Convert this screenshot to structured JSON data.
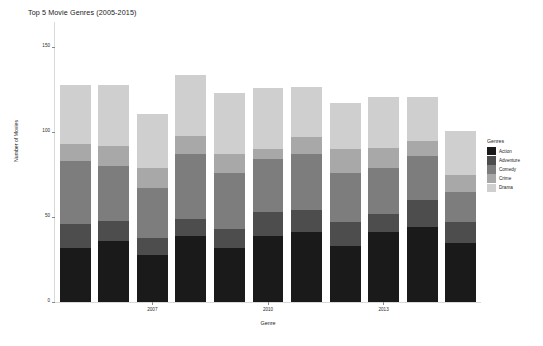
{
  "chart_data": {
    "type": "bar",
    "title": "Top 5 Movie Genres (2005-2015)",
    "xlabel": "Genre",
    "ylabel": "Number of Movies",
    "stacked": true,
    "grid": false,
    "legend_position": "right",
    "legend_title": "Genres",
    "ylim": [
      0,
      165
    ],
    "yticks": [
      0,
      50,
      100,
      150
    ],
    "ytick_labels": [
      "0",
      "50",
      "100",
      "150"
    ],
    "categories": [
      "2005",
      "2006",
      "2007",
      "2008",
      "2009",
      "2010",
      "2011",
      "2012",
      "2013",
      "2014",
      "2015"
    ],
    "xticks": [
      "2007",
      "2010",
      "2013"
    ],
    "series": [
      {
        "name": "Action",
        "color": "#1a1a1a",
        "values": [
          32,
          36,
          28,
          39,
          32,
          39,
          41,
          33,
          41,
          44,
          35
        ]
      },
      {
        "name": "Adventure",
        "color": "#4d4d4d",
        "values": [
          14,
          12,
          10,
          10,
          11,
          14,
          13,
          14,
          11,
          16,
          12
        ]
      },
      {
        "name": "Comedy",
        "color": "#7d7d7d",
        "values": [
          37,
          32,
          29,
          38,
          33,
          31,
          33,
          29,
          27,
          26,
          18
        ]
      },
      {
        "name": "Crime",
        "color": "#a8a8a8",
        "values": [
          10,
          12,
          12,
          11,
          11,
          6,
          10,
          14,
          12,
          9,
          10
        ]
      },
      {
        "name": "Drama",
        "color": "#cfcfcf",
        "values": [
          35,
          36,
          32,
          36,
          36,
          36,
          30,
          27,
          30,
          26,
          26
        ]
      }
    ]
  }
}
